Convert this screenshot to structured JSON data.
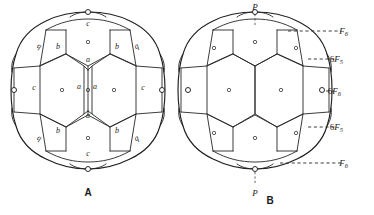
{
  "figure": {
    "panels": [
      {
        "id": "A",
        "caption": "A",
        "caption_x": 88,
        "caption_y": 196,
        "center_x": 88,
        "center_y": 95,
        "face_labels": [
          {
            "text": "c",
            "x": 88,
            "y": 26,
            "rotate": 0,
            "name": "face-label-c-top"
          },
          {
            "text": "b",
            "x": 58,
            "y": 49,
            "rotate": 0,
            "name": "face-label-b-upper-left"
          },
          {
            "text": "b",
            "x": 117,
            "y": 49,
            "rotate": 0,
            "name": "face-label-b-upper-right"
          },
          {
            "text": "b",
            "x": 40,
            "y": 45,
            "rotate": 205,
            "name": "face-label-b-rot-upper-left"
          },
          {
            "text": "b",
            "x": 136,
            "y": 45,
            "rotate": 155,
            "name": "face-label-b-rot-upper-right"
          },
          {
            "text": "a",
            "x": 88,
            "y": 62,
            "rotate": 0,
            "name": "face-label-a-upper"
          },
          {
            "text": "a",
            "x": 79,
            "y": 89,
            "rotate": 0,
            "name": "face-label-a-center-left"
          },
          {
            "text": "a",
            "x": 95,
            "y": 89,
            "rotate": 0,
            "name": "face-label-a-center-right"
          },
          {
            "text": "a",
            "x": 88,
            "y": 118,
            "rotate": 0,
            "name": "face-label-a-lower"
          },
          {
            "text": "c",
            "x": 34,
            "y": 90,
            "rotate": 0,
            "name": "face-label-c-left"
          },
          {
            "text": "c",
            "x": 143,
            "y": 90,
            "rotate": 0,
            "name": "face-label-c-right"
          },
          {
            "text": "b",
            "x": 58,
            "y": 133,
            "rotate": 0,
            "name": "face-label-b-lower-left"
          },
          {
            "text": "b",
            "x": 117,
            "y": 133,
            "rotate": 0,
            "name": "face-label-b-lower-right"
          },
          {
            "text": "b",
            "x": 40,
            "y": 137,
            "rotate": 205,
            "name": "face-label-b-rot-lower-left"
          },
          {
            "text": "b",
            "x": 136,
            "y": 137,
            "rotate": 155,
            "name": "face-label-b-rot-lower-right"
          },
          {
            "text": "c",
            "x": 88,
            "y": 156,
            "rotate": 0,
            "name": "face-label-c-bottom"
          }
        ],
        "face_centers": [
          {
            "x": 88,
            "y": 42,
            "name": "face-center-dot-top"
          },
          {
            "x": 88,
            "y": 90,
            "name": "face-center-dot-middle-left"
          },
          {
            "x": 62,
            "y": 90,
            "name": "face-center-dot-left"
          },
          {
            "x": 114,
            "y": 90,
            "name": "face-center-dot-right"
          },
          {
            "x": 88,
            "y": 138,
            "name": "face-center-dot-bottom"
          }
        ],
        "vertex_dots": [
          {
            "x": 88,
            "y": 12,
            "name": "vertex-dot-top-pole"
          },
          {
            "x": 88,
            "y": 169,
            "name": "vertex-dot-bottom-pole"
          },
          {
            "x": 14,
            "y": 90,
            "name": "vertex-dot-left-equator"
          },
          {
            "x": 162,
            "y": 90,
            "name": "vertex-dot-right-equator"
          }
        ]
      },
      {
        "id": "B",
        "caption": "B",
        "caption_x": 270,
        "caption_y": 204,
        "center_x": 255,
        "center_y": 95,
        "face_centers": [
          {
            "x": 255,
            "y": 42,
            "name": "face-center-dot-top"
          },
          {
            "x": 229,
            "y": 90,
            "name": "face-center-dot-left"
          },
          {
            "x": 281,
            "y": 90,
            "name": "face-center-dot-right"
          },
          {
            "x": 255,
            "y": 138,
            "name": "face-center-dot-bottom"
          },
          {
            "x": 214,
            "y": 48,
            "name": "face-center-dot-upper-left"
          },
          {
            "x": 296,
            "y": 48,
            "name": "face-center-dot-upper-right"
          },
          {
            "x": 214,
            "y": 133,
            "name": "face-center-dot-lower-left"
          },
          {
            "x": 296,
            "y": 133,
            "name": "face-center-dot-lower-right"
          }
        ],
        "vertex_dots": [
          {
            "x": 255,
            "y": 12,
            "name": "vertex-dot-top-pole"
          },
          {
            "x": 255,
            "y": 169,
            "name": "vertex-dot-bottom-pole"
          },
          {
            "x": 322,
            "y": 90,
            "name": "vertex-dot-right-equator"
          },
          {
            "x": 188,
            "y": 90,
            "name": "vertex-dot-left-equator"
          }
        ],
        "pole_labels": [
          {
            "text": "P",
            "x": 255,
            "y": 10,
            "name": "pole-label-top",
            "leader": {
              "x1": 255,
              "y1": 14,
              "x2": 255,
              "y2": 26
            }
          },
          {
            "text": "P",
            "x": 255,
            "y": 196,
            "name": "pole-label-bottom",
            "leader": {
              "x1": 255,
              "y1": 172,
              "x2": 255,
              "y2": 184
            }
          }
        ],
        "annotations": [
          {
            "name": "annotation-f6-top",
            "prefix": "",
            "symbol": "F",
            "subscript": "6",
            "text_x": 348,
            "text_y": 34,
            "leader": {
              "x1": 288,
              "y1": 31,
              "x2": 341,
              "y2": 31
            }
          },
          {
            "name": "annotation-6f5-upper",
            "prefix": "6",
            "symbol": "F",
            "subscript": "5",
            "text_x": 343,
            "text_y": 62,
            "leader": {
              "x1": 308,
              "y1": 59,
              "x2": 336,
              "y2": 59
            }
          },
          {
            "name": "annotation-6f6-equator",
            "prefix": "6",
            "symbol": "F",
            "subscript": "6",
            "text_x": 341,
            "text_y": 94,
            "leader": {
              "x1": 326,
              "y1": 91,
              "x2": 334,
              "y2": 91
            }
          },
          {
            "name": "annotation-6f5-lower",
            "prefix": "6",
            "symbol": "F",
            "subscript": "5",
            "text_x": 343,
            "text_y": 130,
            "leader": {
              "x1": 308,
              "y1": 127,
              "x2": 336,
              "y2": 127
            }
          },
          {
            "name": "annotation-f6-bottom",
            "prefix": "",
            "symbol": "F",
            "subscript": "6",
            "text_x": 348,
            "text_y": 166,
            "leader": {
              "x1": 280,
              "y1": 163,
              "x2": 341,
              "y2": 163
            }
          }
        ]
      }
    ],
    "colors": {
      "ink": "#1a1a1a",
      "line": "#262626",
      "background": "#ffffff"
    }
  }
}
